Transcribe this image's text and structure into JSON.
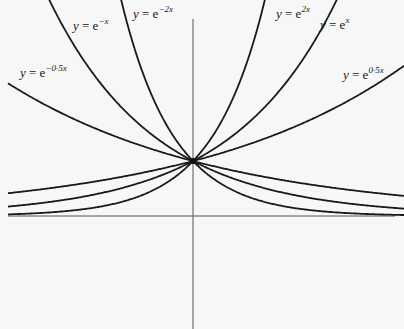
{
  "chart_data": {
    "type": "line",
    "title": "",
    "xlabel": "",
    "ylabel": "",
    "grid": false,
    "legend": "none (curves labelled inline)",
    "axes": {
      "x_axis_y": 0,
      "y_axis_x": 0,
      "x_range": [
        -1.8,
        2.0
      ],
      "y_range": [
        -2.0,
        3.9
      ]
    },
    "series": [
      {
        "name": "y=e^{-0.5x}",
        "label_prefix": "y",
        "label_exp": "−0·5x",
        "k": -0.5,
        "x": [
          -1.8,
          -1.0,
          0,
          1.0,
          1.85
        ],
        "values": [
          2.46,
          1.65,
          1.0,
          0.61,
          0.4
        ]
      },
      {
        "name": "y=e^{-x}",
        "label_prefix": "y",
        "label_exp": "−x",
        "k": -1.0,
        "x": [
          -1.3,
          -0.5,
          0,
          1.0,
          1.85
        ],
        "values": [
          3.67,
          1.65,
          1.0,
          0.37,
          0.16
        ]
      },
      {
        "name": "y=e^{-2x}",
        "label_prefix": "y",
        "label_exp": "−2x",
        "k": -2.0,
        "x": [
          -0.67,
          -0.25,
          0,
          1.0,
          1.85
        ],
        "values": [
          3.82,
          1.65,
          1.0,
          0.14,
          0.02
        ]
      },
      {
        "name": "y=e^{2x}",
        "label_prefix": "y",
        "label_exp": "2x",
        "k": 2.0,
        "x": [
          -1.8,
          -1.0,
          0,
          0.25,
          0.68
        ],
        "values": [
          0.03,
          0.14,
          1.0,
          1.65,
          3.9
        ]
      },
      {
        "name": "y=e^{x}",
        "label_prefix": "y",
        "label_exp": "x",
        "k": 1.0,
        "x": [
          -1.8,
          -1.0,
          0,
          0.5,
          1.3
        ],
        "values": [
          0.17,
          0.37,
          1.0,
          1.65,
          3.67
        ]
      },
      {
        "name": "y=e^{0.5x}",
        "label_prefix": "y",
        "label_exp": "0·5x",
        "k": 0.5,
        "x": [
          -1.8,
          -1.0,
          0,
          1.0,
          2.0
        ],
        "values": [
          0.41,
          0.61,
          1.0,
          1.65,
          2.72
        ]
      }
    ],
    "annotations": [
      "y = e^{−0.5x}",
      "y = e^{−x}",
      "y = e^{−2x}",
      "y = e^{2x}",
      "y = e^{x}",
      "y = e^{0·5x}"
    ],
    "common_point": {
      "x": 0,
      "y": 1
    }
  },
  "labels": [
    {
      "id": "e-neg-half-x",
      "prefix": "y",
      "eq": " = e",
      "exp": "−0·5x",
      "left": 20,
      "top": 64
    },
    {
      "id": "e-neg-x",
      "prefix": "y",
      "eq": " = e",
      "exp": "−x",
      "left": 73,
      "top": 17
    },
    {
      "id": "e-neg-2x",
      "prefix": "y",
      "eq": " = e",
      "exp": "−2x",
      "left": 133,
      "top": 5
    },
    {
      "id": "e-2x",
      "prefix": "y",
      "eq": " = e",
      "exp": "2x",
      "left": 276,
      "top": 5
    },
    {
      "id": "e-x",
      "prefix": "y",
      "eq": " = e",
      "exp": "x",
      "left": 320,
      "top": 16
    },
    {
      "id": "e-half-x",
      "prefix": "y",
      "eq": " = e",
      "exp": "0·5x",
      "left": 343,
      "top": 66
    }
  ]
}
